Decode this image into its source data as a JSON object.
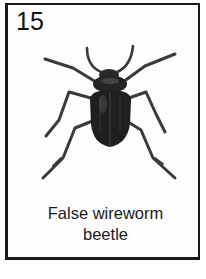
{
  "card": {
    "number": "15",
    "caption_line1": "False wireworm",
    "caption_line2": "beetle",
    "illustration": "beetle-illustration"
  },
  "colors": {
    "border": "#1a1a1a",
    "ink": "#222222",
    "background": "#ffffff"
  }
}
